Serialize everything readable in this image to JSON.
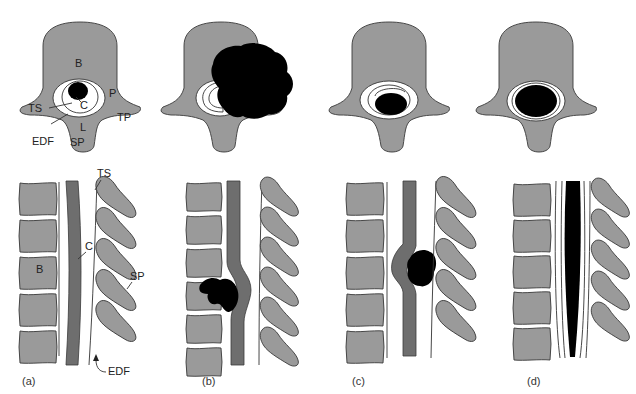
{
  "figure": {
    "panels": [
      {
        "id": "a",
        "caption": "(a)",
        "state": "normal anatomy"
      },
      {
        "id": "b",
        "caption": "(b)",
        "state": "tumour arising from vertebral body and extending into canal"
      },
      {
        "id": "c",
        "caption": "(c)",
        "state": "extradural mass compressing cord"
      },
      {
        "id": "d",
        "caption": "(d)",
        "state": "intramedullary expansion of cord"
      }
    ],
    "labels_axial": {
      "body": "B",
      "cord": "C",
      "thecal_sac": "TS",
      "pedicle": "P",
      "transverse_process": "TP",
      "lamina": "L",
      "spinous_process": "SP",
      "extradural_fat": "EDF"
    },
    "labels_sagittal": {
      "thecal_sac": "TS",
      "cord": "C",
      "body": "B",
      "spinous_process": "SP",
      "extradural_fat": "EDF"
    },
    "colors": {
      "bone": "#9a9a9a",
      "cord": "#6e6e6e",
      "tumour": "#000000",
      "background": "#ffffff"
    }
  }
}
